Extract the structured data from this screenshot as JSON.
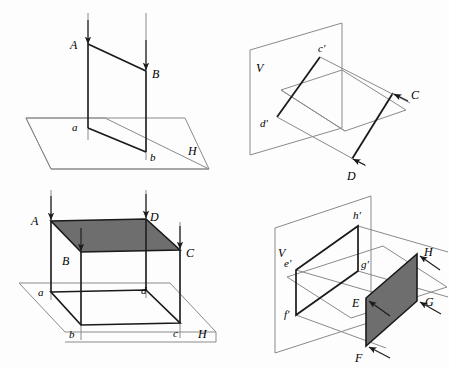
{
  "figure": {
    "background": "#fdfdfd",
    "line_color": "#8a8a8a",
    "edge_color": "#1a1a1a",
    "shade_color": "#6e6e6e",
    "panels": [
      {
        "id": "panel-top-left",
        "name": "line-projection-onto-horizontal-plane",
        "plane_label": "H",
        "labels": [
          {
            "key": "A",
            "text": "A",
            "x": 75,
            "y": 45
          },
          {
            "key": "B",
            "text": "B",
            "x": 155,
            "y": 72
          },
          {
            "key": "a",
            "text": "a",
            "x": 74,
            "y": 128
          },
          {
            "key": "b",
            "text": "b",
            "x": 152,
            "y": 155
          },
          {
            "key": "H",
            "text": "H",
            "x": 193,
            "y": 150
          }
        ]
      },
      {
        "id": "panel-top-right",
        "name": "line-projection-onto-vertical-plane",
        "plane_label": "V",
        "labels": [
          {
            "key": "V",
            "text": "V",
            "x": 257,
            "y": 65
          },
          {
            "key": "cp",
            "text": "c'",
            "x": 323,
            "y": 52
          },
          {
            "key": "dp",
            "text": "d'",
            "x": 262,
            "y": 119
          },
          {
            "key": "C",
            "text": "C",
            "x": 403,
            "y": 95
          },
          {
            "key": "D",
            "text": "D",
            "x": 345,
            "y": 172
          }
        ]
      },
      {
        "id": "panel-bottom-left",
        "name": "plane-projection-onto-horizontal-plane",
        "plane_label": "H",
        "labels": [
          {
            "key": "A",
            "text": "A",
            "x": 33,
            "y": 219
          },
          {
            "key": "D",
            "text": "D",
            "x": 150,
            "y": 216
          },
          {
            "key": "B",
            "text": "B",
            "x": 64,
            "y": 256
          },
          {
            "key": "C",
            "text": "C",
            "x": 185,
            "y": 252
          },
          {
            "key": "a",
            "text": "a",
            "x": 40,
            "y": 295
          },
          {
            "key": "d",
            "text": "d",
            "x": 144,
            "y": 293
          },
          {
            "key": "b",
            "text": "b",
            "x": 71,
            "y": 337
          },
          {
            "key": "c",
            "text": "c",
            "x": 175,
            "y": 336
          },
          {
            "key": "H",
            "text": "H",
            "x": 203,
            "y": 333
          }
        ]
      },
      {
        "id": "panel-bottom-right",
        "name": "plane-projection-onto-vertical-plane",
        "plane_label": "V",
        "labels": [
          {
            "key": "V",
            "text": "V",
            "x": 281,
            "y": 252
          },
          {
            "key": "hp",
            "text": "h'",
            "x": 355,
            "y": 218
          },
          {
            "key": "ep",
            "text": "e'",
            "x": 288,
            "y": 262
          },
          {
            "key": "gp",
            "text": "g'",
            "x": 361,
            "y": 263
          },
          {
            "key": "fp",
            "text": "f'",
            "x": 287,
            "y": 313
          },
          {
            "key": "E",
            "text": "E",
            "x": 355,
            "y": 307
          },
          {
            "key": "H",
            "text": "H",
            "x": 427,
            "y": 258
          },
          {
            "key": "G",
            "text": "G",
            "x": 428,
            "y": 304
          },
          {
            "key": "F",
            "text": "F",
            "x": 357,
            "y": 355
          }
        ]
      }
    ]
  }
}
